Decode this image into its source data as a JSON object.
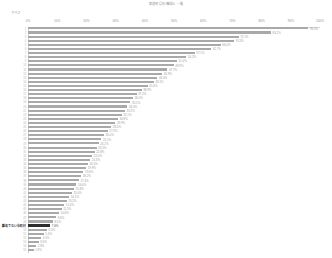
{
  "header": {
    "title": "都道府県別 構成比 一覧",
    "axis_name": "グラフ"
  },
  "axis": {
    "ticks": [
      "0%",
      "10%",
      "20%",
      "30%",
      "40%",
      "50%",
      "60%",
      "70%",
      "80%",
      "90%",
      "100%"
    ],
    "min": 0,
    "max": 100
  },
  "colors": {
    "bar": "#a9a9a9",
    "bar_highlight": "#2d2d2d",
    "label": "#9b9b9b",
    "axis": "#d8d8d8"
  },
  "chart_data": {
    "type": "bar",
    "title": "都道府県別 構成比 一覧",
    "xlabel": "",
    "ylabel": "",
    "xlim": [
      0,
      100
    ],
    "grid": false,
    "legend": null,
    "orientation": "horizontal",
    "highlight_index": 48,
    "categories": [
      "1",
      "2",
      "3",
      "4",
      "5",
      "6",
      "7",
      "8",
      "9",
      "10",
      "11",
      "12",
      "13",
      "14",
      "15",
      "16",
      "17",
      "18",
      "19",
      "20",
      "21",
      "22",
      "23",
      "24",
      "25",
      "26",
      "27",
      "28",
      "29",
      "30",
      "31",
      "32",
      "33",
      "34",
      "35",
      "36",
      "37",
      "38",
      "39",
      "40",
      "41",
      "42",
      "43",
      "44",
      "45",
      "46",
      "47",
      "48",
      "離島でない市町村",
      "50",
      "51",
      "52",
      "53",
      "54",
      "55"
    ],
    "values": [
      96.0,
      83.2,
      72.1,
      70.5,
      66.0,
      62.7,
      57.1,
      54.2,
      51.0,
      49.9,
      47.7,
      45.9,
      44.3,
      43.1,
      41.0,
      38.9,
      37.2,
      36.0,
      35.1,
      34.0,
      33.2,
      32.1,
      30.8,
      29.9,
      28.5,
      27.3,
      26.0,
      25.1,
      24.2,
      23.5,
      22.8,
      22.0,
      21.3,
      20.5,
      19.9,
      19.0,
      18.2,
      17.4,
      16.6,
      15.8,
      15.0,
      14.1,
      13.2,
      12.4,
      11.5,
      10.6,
      9.6,
      8.5,
      7.6,
      6.5,
      5.4,
      4.5,
      3.6,
      2.8,
      1.9
    ],
    "value_labels": [
      "96.0%",
      "83.2%",
      "72.1%",
      "70.5%",
      "66.0%",
      "62.7%",
      "57.1%",
      "54.2%",
      "51.0%",
      "49.9%",
      "47.7%",
      "45.9%",
      "44.3%",
      "43.1%",
      "41.0%",
      "38.9%",
      "37.2%",
      "36.0%",
      "35.1%",
      "34.0%",
      "33.2%",
      "32.1%",
      "30.8%",
      "29.9%",
      "28.5%",
      "27.3%",
      "26.0%",
      "25.1%",
      "24.2%",
      "23.5%",
      "22.8%",
      "22.0%",
      "21.3%",
      "20.5%",
      "19.9%",
      "19.0%",
      "18.2%",
      "17.4%",
      "16.6%",
      "15.8%",
      "15.0%",
      "14.1%",
      "13.2%",
      "12.4%",
      "11.5%",
      "10.6%",
      "9.6%",
      "8.5%",
      "7.6%",
      "6.5%",
      "5.4%",
      "4.5%",
      "3.6%",
      "2.8%",
      "1.9%"
    ]
  }
}
